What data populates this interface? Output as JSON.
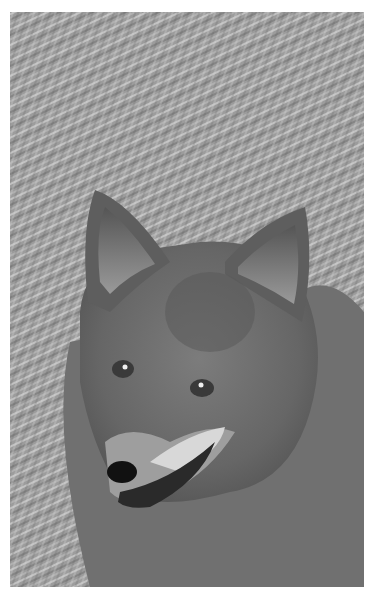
{
  "image": {
    "subject": "coyote",
    "description": "Grayscale close-up portrait of a coyote lying in dry grass, looking toward the viewer",
    "colors": {
      "background": "#ffffff",
      "grass_light": "#c8c8c8",
      "grass_mid": "#9a9a9a",
      "fur_dark": "#4a4a4a",
      "fur_mid": "#767676",
      "fur_light": "#a8a8a8",
      "muzzle_white": "#d8d8d8",
      "nose": "#111111",
      "eye": "#3a3a3a",
      "eye_glint": "#f0f0f0"
    }
  }
}
